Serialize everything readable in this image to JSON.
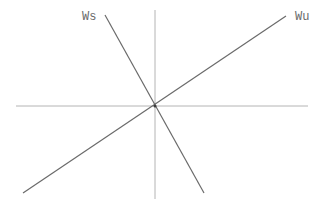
{
  "diagram": {
    "title": "",
    "axes": {
      "horizontal": {
        "x1": 16,
        "y1": 106,
        "x2": 308,
        "y2": 106
      },
      "vertical": {
        "x1": 155,
        "y1": 10,
        "x2": 155,
        "y2": 199
      }
    },
    "origin": {
      "x": 155,
      "y": 106
    },
    "lines": [
      {
        "name": "unstable-manifold",
        "label": "Wu",
        "x1": 23,
        "y1": 193,
        "x2": 286,
        "y2": 16,
        "label_x": 295,
        "label_y": 20
      },
      {
        "name": "stable-manifold",
        "label": "Ws",
        "x1": 105,
        "y1": 15,
        "x2": 204,
        "y2": 193,
        "label_x": 82,
        "label_y": 20
      }
    ],
    "colors": {
      "axis": "#b4b4b4",
      "line": "#6a6a6a",
      "background": "#ffffff"
    }
  }
}
